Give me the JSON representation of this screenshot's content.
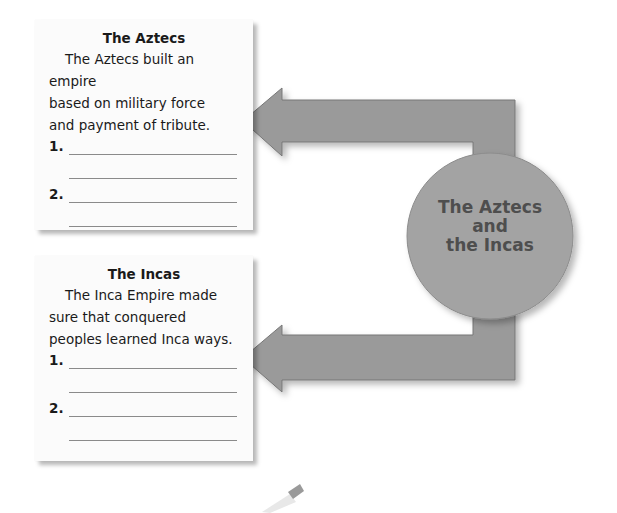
{
  "hub": {
    "line1": "The Aztecs",
    "line2": "and",
    "line3": "the Incas"
  },
  "cards": [
    {
      "title": "The Aztecs",
      "body": [
        "The Aztecs built an empire",
        "based on military force",
        "and payment of tribute."
      ],
      "blanks": [
        {
          "number": "1."
        },
        {
          "number": "2."
        }
      ]
    },
    {
      "title": "The Incas",
      "body": [
        "The Inca Empire made",
        "sure that conquered",
        "peoples learned Inca ways."
      ],
      "blanks": [
        {
          "number": "1."
        },
        {
          "number": "2."
        }
      ]
    }
  ],
  "colors": {
    "arrow": "#9a9a9a",
    "arrow_edge": "#6f6f6f",
    "circle": "#a3a3a3",
    "hub_text": "#4e4e4e",
    "card_bg": "#fbfbfb"
  }
}
